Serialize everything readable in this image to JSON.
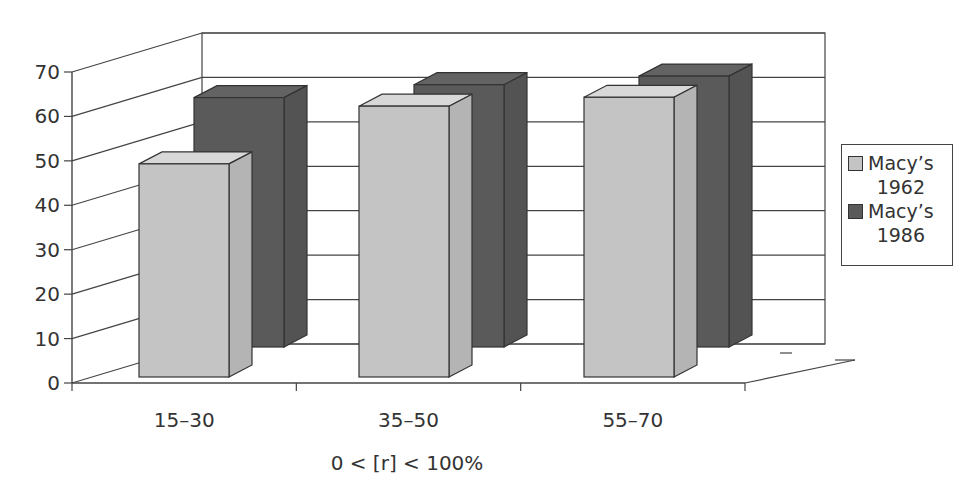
{
  "chart_data": {
    "type": "bar",
    "style": "3d-clustered-column",
    "title": "",
    "xlabel": "0 < [r] < 100%",
    "ylabel": "",
    "categories": [
      "15–30",
      "35–50",
      "55–70"
    ],
    "series": [
      {
        "name": "Macy’s 1962",
        "color": "#c4c4c4",
        "values": [
          48,
          61,
          63
        ]
      },
      {
        "name": "Macy’s 1986",
        "color": "#5a5a5a",
        "values": [
          58,
          61,
          63
        ]
      }
    ],
    "ylim": [
      0,
      70
    ],
    "yticks": [
      0,
      10,
      20,
      30,
      40,
      50,
      60,
      70
    ],
    "grid": true,
    "legend_position": "right"
  },
  "legend": {
    "items": [
      {
        "label": "Macy’s\n1962",
        "color": "#c4c4c4"
      },
      {
        "label": "Macy’s\n1986",
        "color": "#5a5a5a"
      }
    ]
  },
  "axis": {
    "xlabel": "0 < [r] < 100%",
    "categories": [
      "15–30",
      "35–50",
      "55–70"
    ],
    "yticks": [
      "0",
      "10",
      "20",
      "30",
      "40",
      "50",
      "60",
      "70"
    ]
  }
}
